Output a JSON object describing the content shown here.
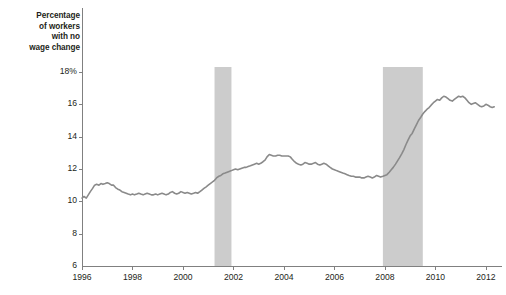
{
  "chart_data": {
    "type": "line",
    "title": "",
    "subtitle": "",
    "xlabel": "",
    "ylabel": "Percentage of workers with no wage change",
    "ylabel_lines": [
      "Percentage",
      "of workers",
      "with no",
      "wage change"
    ],
    "xlim": [
      1996.0,
      2012.4
    ],
    "ylim": [
      6,
      18.6
    ],
    "yticks": [
      8,
      10,
      12,
      14,
      16,
      18
    ],
    "ytick_labels": [
      "8",
      "10",
      "12",
      "14",
      "16",
      "18%"
    ],
    "xticks": [
      1996,
      1998,
      2000,
      2002,
      2004,
      2006,
      2008,
      2010,
      2012
    ],
    "xtick_labels": [
      "1996",
      "1998",
      "2000",
      "2002",
      "2004",
      "2006",
      "2008",
      "2010",
      "2012"
    ],
    "axis_baseline_value": 6,
    "grid": false,
    "legend": null,
    "legend_position": "none",
    "line_color": "#8a8a8a",
    "line_width": 1.6,
    "band_color": "#cccccc",
    "axis_color": "#808080",
    "text_color": "#231f20",
    "background": "#ffffff",
    "shaded_regions": [
      {
        "name": "recession-2001",
        "x_start": 2001.25,
        "x_end": 2001.92,
        "label": ""
      },
      {
        "name": "recession-2008",
        "x_start": 2007.92,
        "x_end": 2009.5,
        "label": ""
      }
    ],
    "series": [
      {
        "name": "Percentage of workers with no wage change",
        "color": "#8a8a8a",
        "x": [
          1996.0,
          1996.08,
          1996.17,
          1996.25,
          1996.33,
          1996.42,
          1996.5,
          1996.58,
          1996.67,
          1996.75,
          1996.83,
          1996.92,
          1997.0,
          1997.08,
          1997.17,
          1997.25,
          1997.33,
          1997.42,
          1997.5,
          1997.58,
          1997.67,
          1997.75,
          1997.83,
          1997.92,
          1998.0,
          1998.08,
          1998.17,
          1998.25,
          1998.33,
          1998.42,
          1998.5,
          1998.58,
          1998.67,
          1998.75,
          1998.83,
          1998.92,
          1999.0,
          1999.08,
          1999.17,
          1999.25,
          1999.33,
          1999.42,
          1999.5,
          1999.58,
          1999.67,
          1999.75,
          1999.83,
          1999.92,
          2000.0,
          2000.08,
          2000.17,
          2000.25,
          2000.33,
          2000.42,
          2000.5,
          2000.58,
          2000.67,
          2000.75,
          2000.83,
          2000.92,
          2001.0,
          2001.08,
          2001.17,
          2001.25,
          2001.33,
          2001.42,
          2001.5,
          2001.58,
          2001.67,
          2001.75,
          2001.83,
          2001.92,
          2002.0,
          2002.08,
          2002.17,
          2002.25,
          2002.33,
          2002.42,
          2002.5,
          2002.58,
          2002.67,
          2002.75,
          2002.83,
          2002.92,
          2003.0,
          2003.08,
          2003.17,
          2003.25,
          2003.33,
          2003.42,
          2003.5,
          2003.58,
          2003.67,
          2003.75,
          2003.83,
          2003.92,
          2004.0,
          2004.08,
          2004.17,
          2004.25,
          2004.33,
          2004.42,
          2004.5,
          2004.58,
          2004.67,
          2004.75,
          2004.83,
          2004.92,
          2005.0,
          2005.08,
          2005.17,
          2005.25,
          2005.33,
          2005.42,
          2005.5,
          2005.58,
          2005.67,
          2005.75,
          2005.83,
          2005.92,
          2006.0,
          2006.08,
          2006.17,
          2006.25,
          2006.33,
          2006.42,
          2006.5,
          2006.58,
          2006.67,
          2006.75,
          2006.83,
          2006.92,
          2007.0,
          2007.08,
          2007.17,
          2007.25,
          2007.33,
          2007.42,
          2007.5,
          2007.58,
          2007.67,
          2007.75,
          2007.83,
          2007.92,
          2008.0,
          2008.08,
          2008.17,
          2008.25,
          2008.33,
          2008.42,
          2008.5,
          2008.58,
          2008.67,
          2008.75,
          2008.83,
          2008.92,
          2009.0,
          2009.08,
          2009.17,
          2009.25,
          2009.33,
          2009.42,
          2009.5,
          2009.58,
          2009.67,
          2009.75,
          2009.83,
          2009.92,
          2010.0,
          2010.08,
          2010.17,
          2010.25,
          2010.33,
          2010.42,
          2010.5,
          2010.58,
          2010.67,
          2010.75,
          2010.83,
          2010.92,
          2011.0,
          2011.08,
          2011.17,
          2011.25,
          2011.33,
          2011.42,
          2011.5,
          2011.58,
          2011.67,
          2011.75,
          2011.83,
          2011.92,
          2012.0,
          2012.08,
          2012.17,
          2012.25,
          2012.33
        ],
        "values": [
          10.2,
          10.3,
          10.2,
          10.4,
          10.6,
          10.8,
          11.0,
          11.05,
          11.0,
          11.1,
          11.05,
          11.1,
          11.15,
          11.1,
          11.0,
          11.0,
          10.85,
          10.75,
          10.7,
          10.6,
          10.55,
          10.5,
          10.45,
          10.4,
          10.45,
          10.4,
          10.45,
          10.5,
          10.45,
          10.4,
          10.45,
          10.5,
          10.45,
          10.4,
          10.4,
          10.45,
          10.4,
          10.45,
          10.5,
          10.45,
          10.4,
          10.45,
          10.55,
          10.6,
          10.5,
          10.45,
          10.5,
          10.6,
          10.55,
          10.5,
          10.55,
          10.5,
          10.45,
          10.5,
          10.55,
          10.5,
          10.6,
          10.7,
          10.8,
          10.9,
          11.0,
          11.1,
          11.2,
          11.3,
          11.45,
          11.55,
          11.6,
          11.7,
          11.75,
          11.8,
          11.85,
          11.9,
          11.95,
          12.0,
          11.95,
          12.0,
          12.05,
          12.1,
          12.1,
          12.15,
          12.2,
          12.25,
          12.3,
          12.35,
          12.3,
          12.35,
          12.45,
          12.55,
          12.75,
          12.9,
          12.85,
          12.8,
          12.8,
          12.85,
          12.85,
          12.8,
          12.8,
          12.8,
          12.8,
          12.75,
          12.6,
          12.45,
          12.35,
          12.3,
          12.25,
          12.3,
          12.4,
          12.35,
          12.3,
          12.3,
          12.35,
          12.4,
          12.3,
          12.25,
          12.3,
          12.35,
          12.3,
          12.2,
          12.1,
          12.0,
          11.95,
          11.9,
          11.85,
          11.8,
          11.75,
          11.7,
          11.65,
          11.6,
          11.55,
          11.55,
          11.5,
          11.5,
          11.5,
          11.45,
          11.45,
          11.5,
          11.55,
          11.5,
          11.45,
          11.5,
          11.6,
          11.55,
          11.5,
          11.55,
          11.6,
          11.65,
          11.8,
          11.95,
          12.1,
          12.3,
          12.5,
          12.7,
          12.95,
          13.2,
          13.5,
          13.8,
          14.05,
          14.2,
          14.5,
          14.75,
          15.0,
          15.2,
          15.4,
          15.55,
          15.7,
          15.8,
          15.95,
          16.1,
          16.2,
          16.3,
          16.25,
          16.4,
          16.5,
          16.45,
          16.35,
          16.25,
          16.2,
          16.3,
          16.4,
          16.5,
          16.45,
          16.5,
          16.4,
          16.25,
          16.1,
          16.0,
          16.05,
          16.1,
          16.0,
          15.9,
          15.85,
          15.9,
          16.0,
          15.95,
          15.85,
          15.8,
          15.85
        ]
      }
    ]
  }
}
